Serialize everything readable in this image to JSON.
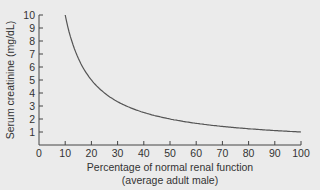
{
  "chart_data": {
    "type": "line",
    "title": "",
    "xlabel": "Percentage of normal renal function",
    "xlabel_sub": "(average adult male)",
    "ylabel": "Serum creatinine (mg/dL)",
    "xlim": [
      0,
      100
    ],
    "ylim": [
      0,
      10
    ],
    "xticks": [
      0,
      10,
      20,
      30,
      40,
      50,
      60,
      70,
      80,
      90,
      100
    ],
    "yticks": [
      1,
      2,
      3,
      4,
      5,
      6,
      7,
      8,
      9,
      10
    ],
    "grid": false,
    "legend": null,
    "series": [
      {
        "name": "Serum creatinine",
        "x": [
          10,
          12,
          15,
          20,
          25,
          30,
          35,
          40,
          50,
          60,
          70,
          80,
          90,
          100
        ],
        "values": [
          10.0,
          8.3,
          6.7,
          5.0,
          4.0,
          3.3,
          2.9,
          2.5,
          2.0,
          1.7,
          1.4,
          1.25,
          1.1,
          1.0
        ],
        "color": "#555555"
      }
    ]
  },
  "colors": {
    "background": "#ebebeb",
    "axis": "#444444",
    "curve": "#555555"
  }
}
